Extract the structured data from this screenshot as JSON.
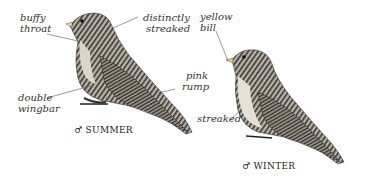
{
  "illustrations": [
    {
      "name": "summer-male",
      "caption_symbol": "♂",
      "caption": "SUMMER",
      "labels": [
        {
          "line1": "buffy",
          "line2": "throat"
        },
        {
          "line1": "distinctly",
          "line2": "streaked"
        },
        {
          "line1": "pink",
          "line2": "rump"
        },
        {
          "line1": "double",
          "line2": "wingbar"
        }
      ]
    },
    {
      "name": "winter-male",
      "caption_symbol": "♂",
      "caption": "WINTER",
      "labels": [
        {
          "line1": "yellow",
          "line2": "bill"
        },
        {
          "line1": "streaked",
          "line2": ""
        }
      ]
    }
  ]
}
